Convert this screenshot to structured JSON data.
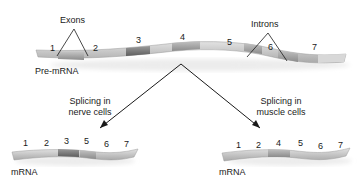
{
  "diagram": {
    "pre_mrna": {
      "label": "Pre-mRNA",
      "segments": [
        "1",
        "2",
        "3",
        "4",
        "5",
        "6",
        "7"
      ],
      "callouts": {
        "exons": "Exons",
        "introns": "Introns"
      }
    },
    "branches": [
      {
        "caption_line1": "Splicing in",
        "caption_line2": "nerve cells",
        "mrna_label": "mRNA",
        "segments": [
          "1",
          "2",
          "3",
          "5",
          "6",
          "7"
        ]
      },
      {
        "caption_line1": "Splicing in",
        "caption_line2": "muscle cells",
        "mrna_label": "mRNA",
        "segments": [
          "1",
          "2",
          "4",
          "5",
          "6",
          "7"
        ]
      }
    ],
    "colors": {
      "strand_light": "#c9c9c9",
      "strand_mid": "#a8a8a8",
      "strand_dark": "#6e6e6e",
      "shadow": "#e6e6e6",
      "line": "#1a1a1a"
    }
  }
}
